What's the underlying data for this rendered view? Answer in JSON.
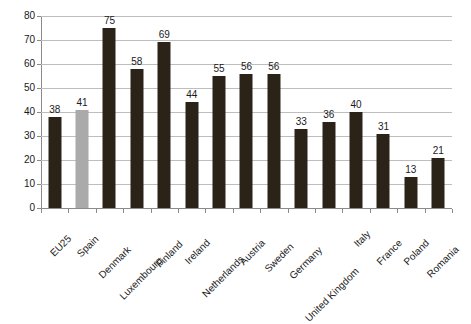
{
  "chart_data": {
    "type": "bar",
    "title": "",
    "subtitle": "",
    "xlabel": "",
    "ylabel": "",
    "ylim": [
      0,
      80
    ],
    "ytick_step": 10,
    "yticks": [
      0,
      10,
      20,
      30,
      40,
      50,
      60,
      70,
      80
    ],
    "grid": true,
    "legend": "none",
    "categories": [
      "EU25",
      "Spain",
      "Denmark",
      "Luxembourg",
      "Finland",
      "Ireland",
      "Netherlands",
      "Austria",
      "Sweden",
      "Germany",
      "United Kingdom",
      "Italy",
      "France",
      "Poland",
      "Romania"
    ],
    "values": [
      38,
      41,
      75,
      58,
      69,
      44,
      55,
      56,
      56,
      33,
      36,
      40,
      31,
      13,
      21
    ],
    "bar_colors": [
      "#2b2318",
      "#aaaaaa",
      "#2b2318",
      "#2b2318",
      "#2b2318",
      "#2b2318",
      "#2b2318",
      "#2b2318",
      "#2b2318",
      "#2b2318",
      "#2b2318",
      "#2b2318",
      "#2b2318",
      "#2b2318",
      "#2b2318"
    ],
    "highlight_category": "Spain",
    "data_labels": true,
    "annotations": []
  },
  "colors": {
    "bar_dark": "#2b2318",
    "bar_highlight": "#aaaaaa",
    "gridline": "#bdbdbd",
    "axis": "#8a8a8a",
    "text": "#1a1a1a",
    "background": "#ffffff"
  }
}
